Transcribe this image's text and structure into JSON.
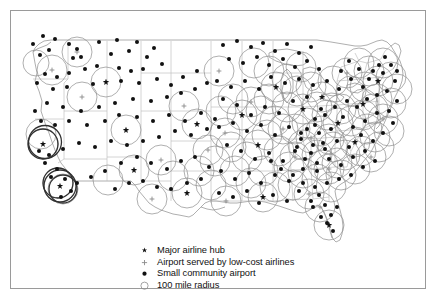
{
  "figure": {
    "title": "",
    "frame_color": "#9a9a9a",
    "background": "#ffffff",
    "map_region": "Continental United States"
  },
  "legend": {
    "items": [
      {
        "marker": "major-hub-star-dot",
        "label": "Major airline hub"
      },
      {
        "marker": "low-cost-cross",
        "label": "Airport served by low-cost airlines"
      },
      {
        "marker": "small-community-dot",
        "label": "Small community airport"
      },
      {
        "marker": "radius-open-circle",
        "label": "100 mile radius"
      }
    ]
  },
  "map_data": {
    "type": "scatter-map",
    "projection": "usa-outline",
    "symbol_colors": {
      "dot": "#111111",
      "circle": "#8d8d8d",
      "hub_circle": "#222222",
      "state_border": "#b3b3b3",
      "coastline": "#9a9a9a"
    },
    "radius_circle_px": 15,
    "hubs": [
      {
        "x": 32,
        "y": 133
      },
      {
        "x": 30,
        "y": 123
      },
      {
        "x": 47,
        "y": 172
      },
      {
        "x": 52,
        "y": 178
      },
      {
        "x": 71,
        "y": 86
      },
      {
        "x": 95,
        "y": 71
      },
      {
        "x": 115,
        "y": 119
      },
      {
        "x": 123,
        "y": 159
      },
      {
        "x": 150,
        "y": 149
      },
      {
        "x": 173,
        "y": 95
      },
      {
        "x": 186,
        "y": 113
      },
      {
        "x": 197,
        "y": 139
      },
      {
        "x": 208,
        "y": 60
      },
      {
        "x": 214,
        "y": 122
      },
      {
        "x": 231,
        "y": 104
      },
      {
        "x": 240,
        "y": 91
      },
      {
        "x": 247,
        "y": 134
      },
      {
        "x": 252,
        "y": 160
      },
      {
        "x": 265,
        "y": 76
      },
      {
        "x": 272,
        "y": 118
      },
      {
        "x": 284,
        "y": 146
      },
      {
        "x": 292,
        "y": 98
      },
      {
        "x": 300,
        "y": 127
      },
      {
        "x": 311,
        "y": 86
      },
      {
        "x": 318,
        "y": 158
      },
      {
        "x": 327,
        "y": 112
      },
      {
        "x": 336,
        "y": 62
      },
      {
        "x": 344,
        "y": 131
      },
      {
        "x": 352,
        "y": 93
      },
      {
        "x": 360,
        "y": 146
      },
      {
        "x": 367,
        "y": 70
      },
      {
        "x": 372,
        "y": 108
      },
      {
        "x": 309,
        "y": 196
      },
      {
        "x": 318,
        "y": 214
      },
      {
        "x": 298,
        "y": 183
      },
      {
        "x": 252,
        "y": 186
      },
      {
        "x": 215,
        "y": 190
      },
      {
        "x": 176,
        "y": 182
      },
      {
        "x": 141,
        "y": 188
      },
      {
        "x": 97,
        "y": 169
      }
    ],
    "counts": {
      "major_hubs": 40,
      "circles_drawn": 112
    }
  }
}
